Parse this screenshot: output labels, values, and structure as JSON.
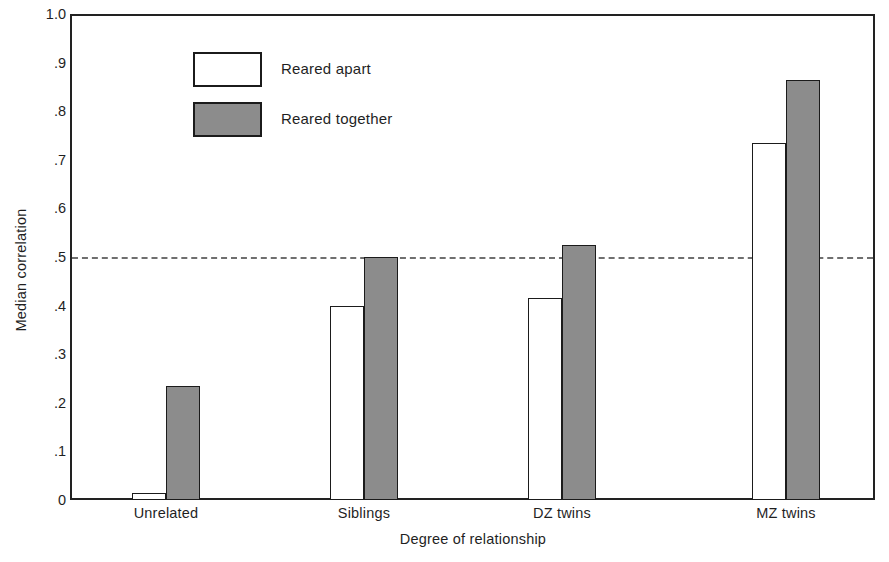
{
  "chart_data": {
    "type": "bar",
    "title": "",
    "xlabel": "Degree of relationship",
    "ylabel": "Median correlation",
    "categories": [
      "Unrelated",
      "Siblings",
      "DZ twins",
      "MZ twins"
    ],
    "series": [
      {
        "name": "Reared apart",
        "values": [
          0.015,
          0.4,
          0.415,
          0.735
        ],
        "color": "#ffffff"
      },
      {
        "name": "Reared together",
        "values": [
          0.235,
          0.5,
          0.525,
          0.865
        ],
        "color": "#8c8c8c"
      }
    ],
    "ylim": [
      0,
      1.0
    ],
    "ytick_values": [
      0,
      0.1,
      0.2,
      0.3,
      0.4,
      0.5,
      0.6,
      0.7,
      0.8,
      0.9,
      1.0
    ],
    "ytick_labels": [
      "0",
      ".1",
      ".2",
      ".3",
      ".4",
      ".5",
      ".6",
      ".7",
      ".8",
      ".9",
      "1.0"
    ],
    "grid": false,
    "legend_position": "upper-left-inside",
    "annotations": [
      {
        "type": "hline",
        "value": 0.5,
        "style": "dashed",
        "color": "#6f6f6f",
        "label": ""
      }
    ]
  },
  "legend": {
    "entries": [
      {
        "label": "Reared apart",
        "swatch": "apart"
      },
      {
        "label": "Reared together",
        "swatch": "together"
      }
    ]
  },
  "axes": {
    "y_title": "Median correlation",
    "x_title": "Degree of relationship"
  },
  "colors": {
    "bar_fill_together": "#8c8c8c",
    "bar_fill_apart": "#ffffff",
    "bar_stroke": "#1b1b1b",
    "axis": "#222222",
    "refline": "#6f6f6f"
  }
}
